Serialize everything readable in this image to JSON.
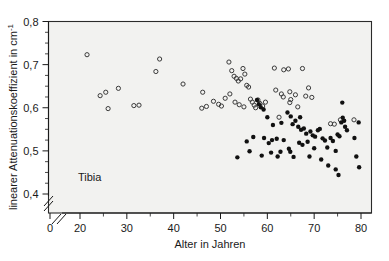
{
  "chart_data": {
    "type": "scatter",
    "title": "",
    "xlabel": "Alter in Jahren",
    "ylabel": "linearer Attenuationskoeffizient in cm",
    "ylabel_exponent": "-1",
    "annotation": "Tibia",
    "xlim": [
      17,
      82
    ],
    "ylim": [
      0.4,
      0.8
    ],
    "xticks": [
      0,
      20,
      30,
      40,
      50,
      60,
      70,
      80
    ],
    "xticklabels": [
      "0",
      "20",
      "30",
      "40",
      "50",
      "60",
      "70",
      "80"
    ],
    "yticks": [
      0.4,
      0.5,
      0.6,
      0.7,
      0.8
    ],
    "yticklabels": [
      "0,4",
      "0,5",
      "0,6",
      "0,7",
      "0,8"
    ],
    "x_minor_step": 5,
    "y_minor_step": 0.025,
    "axis_break_x": true,
    "axis_break_y": true,
    "grid": false,
    "legend_position": "none",
    "marker_colors": {
      "open": "#3a3a3a",
      "filled": "#111111",
      "plot_background": "#f2f2f0",
      "axis": "#1a1a1a"
    },
    "series": [
      {
        "name": "offene Kreise",
        "marker": "open-circle",
        "points": [
          [
            21.5,
            0.723
          ],
          [
            24.3,
            0.628
          ],
          [
            25.5,
            0.636
          ],
          [
            26.0,
            0.598
          ],
          [
            28.2,
            0.645
          ],
          [
            31.5,
            0.605
          ],
          [
            32.6,
            0.606
          ],
          [
            36.2,
            0.684
          ],
          [
            42.0,
            0.655
          ],
          [
            46.2,
            0.636
          ],
          [
            46.0,
            0.599
          ],
          [
            47.0,
            0.603
          ],
          [
            37.0,
            0.713
          ],
          [
            48.5,
            0.615
          ],
          [
            49.6,
            0.608
          ],
          [
            50.2,
            0.604
          ],
          [
            51.0,
            0.622
          ],
          [
            51.8,
            0.706
          ],
          [
            52.4,
            0.686
          ],
          [
            52.9,
            0.673
          ],
          [
            53.4,
            0.668
          ],
          [
            53.8,
            0.662
          ],
          [
            54.3,
            0.667
          ],
          [
            54.8,
            0.691
          ],
          [
            55.2,
            0.678
          ],
          [
            55.6,
            0.652
          ],
          [
            56.0,
            0.648
          ],
          [
            52.0,
            0.632
          ],
          [
            53.1,
            0.613
          ],
          [
            54.0,
            0.607
          ],
          [
            55.0,
            0.602
          ],
          [
            56.4,
            0.62
          ],
          [
            56.8,
            0.613
          ],
          [
            57.2,
            0.606
          ],
          [
            57.5,
            0.6
          ],
          [
            58.0,
            0.618
          ],
          [
            58.4,
            0.61
          ],
          [
            59.0,
            0.604
          ],
          [
            59.6,
            0.613
          ],
          [
            61.5,
            0.692
          ],
          [
            63.5,
            0.688
          ],
          [
            64.5,
            0.69
          ],
          [
            67.5,
            0.691
          ],
          [
            61.8,
            0.641
          ],
          [
            63.0,
            0.632
          ],
          [
            63.4,
            0.625
          ],
          [
            64.8,
            0.637
          ],
          [
            66.0,
            0.63
          ],
          [
            68.8,
            0.646
          ],
          [
            68.2,
            0.627
          ],
          [
            69.5,
            0.624
          ],
          [
            65.0,
            0.619
          ],
          [
            64.8,
            0.612
          ],
          [
            66.5,
            0.602
          ],
          [
            62.5,
            0.578
          ],
          [
            73.5,
            0.563
          ],
          [
            74.3,
            0.562
          ],
          [
            75.6,
            0.572
          ],
          [
            78.5,
            0.572
          ]
        ]
      },
      {
        "name": "gefuellte Kreise",
        "marker": "filled-circle",
        "points": [
          [
            57.8,
            0.618
          ],
          [
            58.2,
            0.608
          ],
          [
            58.6,
            0.601
          ],
          [
            59.2,
            0.596
          ],
          [
            60.0,
            0.578
          ],
          [
            61.2,
            0.56
          ],
          [
            57.0,
            0.532
          ],
          [
            59.3,
            0.53
          ],
          [
            62.0,
            0.528
          ],
          [
            63.5,
            0.525
          ],
          [
            64.3,
            0.589
          ],
          [
            65.0,
            0.58
          ],
          [
            65.4,
            0.562
          ],
          [
            66.0,
            0.57
          ],
          [
            66.6,
            0.556
          ],
          [
            67.2,
            0.549
          ],
          [
            67.8,
            0.552
          ],
          [
            68.3,
            0.54
          ],
          [
            66.8,
            0.519
          ],
          [
            67.5,
            0.514
          ],
          [
            64.6,
            0.505
          ],
          [
            64.9,
            0.498
          ],
          [
            68.6,
            0.521
          ],
          [
            69.2,
            0.545
          ],
          [
            69.7,
            0.536
          ],
          [
            70.2,
            0.533
          ],
          [
            70.8,
            0.548
          ],
          [
            71.2,
            0.551
          ],
          [
            71.8,
            0.529
          ],
          [
            72.3,
            0.524
          ],
          [
            72.8,
            0.508
          ],
          [
            69.0,
            0.487
          ],
          [
            71.5,
            0.48
          ],
          [
            73.5,
            0.53
          ],
          [
            74.0,
            0.523
          ],
          [
            74.6,
            0.5
          ],
          [
            75.0,
            0.538
          ],
          [
            75.4,
            0.534
          ],
          [
            75.8,
            0.566
          ],
          [
            76.1,
            0.577
          ],
          [
            76.4,
            0.57
          ],
          [
            76.0,
            0.612
          ],
          [
            76.6,
            0.556
          ],
          [
            77.0,
            0.548
          ],
          [
            73.0,
            0.466
          ],
          [
            74.6,
            0.457
          ],
          [
            75.2,
            0.444
          ],
          [
            78.6,
            0.53
          ],
          [
            79.5,
            0.566
          ],
          [
            79.0,
            0.487
          ],
          [
            79.6,
            0.462
          ],
          [
            60.8,
            0.496
          ],
          [
            62.2,
            0.487
          ],
          [
            55.6,
            0.522
          ],
          [
            56.2,
            0.499
          ],
          [
            53.6,
            0.485
          ],
          [
            58.8,
            0.489
          ],
          [
            60.3,
            0.518
          ],
          [
            62.8,
            0.498
          ],
          [
            65.6,
            0.486
          ],
          [
            70.0,
            0.506
          ],
          [
            67.0,
            0.578
          ],
          [
            63.0,
            0.565
          ],
          [
            61.0,
            0.525
          ]
        ]
      }
    ]
  }
}
